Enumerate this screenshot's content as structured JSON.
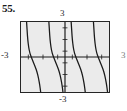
{
  "figure": {
    "exercise_number": "55.",
    "labels": {
      "top": "3",
      "bottom": "-3",
      "left": "-3",
      "right": "3"
    }
  },
  "chart_data": {
    "type": "line",
    "title": "",
    "xlabel": "",
    "ylabel": "",
    "xlim": [
      -3,
      3
    ],
    "ylim": [
      -3,
      3
    ],
    "grid": false,
    "axes_visible": true,
    "tick_labels": {
      "x": [
        "-3",
        "3"
      ],
      "y": [
        "-3",
        "3"
      ]
    },
    "tick_marks_per_axis": 6,
    "legend": null,
    "series": [
      {
        "name": "branch-1",
        "points": [
          [
            -2.62,
            3.0
          ],
          [
            -2.58,
            2.2
          ],
          [
            -2.54,
            1.5
          ],
          [
            -2.48,
            0.85
          ],
          [
            -2.4,
            0.35
          ],
          [
            -2.3,
            0.0
          ],
          [
            -2.18,
            -0.38
          ],
          [
            -2.04,
            -0.8
          ],
          [
            -1.9,
            -1.3
          ],
          [
            -1.8,
            -1.85
          ],
          [
            -1.72,
            -2.4
          ],
          [
            -1.66,
            -3.0
          ]
        ]
      },
      {
        "name": "branch-2",
        "points": [
          [
            -1.1,
            3.0
          ],
          [
            -1.06,
            2.2
          ],
          [
            -1.02,
            1.5
          ],
          [
            -0.96,
            0.85
          ],
          [
            -0.88,
            0.35
          ],
          [
            -0.78,
            0.0
          ],
          [
            -0.66,
            -0.38
          ],
          [
            -0.52,
            -0.8
          ],
          [
            -0.38,
            -1.3
          ],
          [
            -0.28,
            -1.85
          ],
          [
            -0.2,
            -2.4
          ],
          [
            -0.14,
            -3.0
          ]
        ]
      },
      {
        "name": "branch-3",
        "points": [
          [
            0.42,
            3.0
          ],
          [
            0.46,
            2.2
          ],
          [
            0.5,
            1.5
          ],
          [
            0.56,
            0.85
          ],
          [
            0.64,
            0.35
          ],
          [
            0.74,
            0.0
          ],
          [
            0.86,
            -0.38
          ],
          [
            1.0,
            -0.8
          ],
          [
            1.14,
            -1.3
          ],
          [
            1.24,
            -1.85
          ],
          [
            1.32,
            -2.4
          ],
          [
            1.38,
            -3.0
          ]
        ]
      },
      {
        "name": "branch-4",
        "points": [
          [
            1.94,
            3.0
          ],
          [
            1.98,
            2.2
          ],
          [
            2.02,
            1.5
          ],
          [
            2.08,
            0.85
          ],
          [
            2.16,
            0.35
          ],
          [
            2.26,
            0.0
          ],
          [
            2.38,
            -0.38
          ],
          [
            2.52,
            -0.8
          ],
          [
            2.66,
            -1.3
          ],
          [
            2.76,
            -1.85
          ],
          [
            2.84,
            -2.4
          ],
          [
            2.9,
            -3.0
          ]
        ]
      }
    ],
    "colors": {
      "curve": "#1a1a1a",
      "axis": "#1a1a1a",
      "frame": "#262626",
      "plot_background": "#ebebeb",
      "page_background": "#ffffff"
    }
  }
}
